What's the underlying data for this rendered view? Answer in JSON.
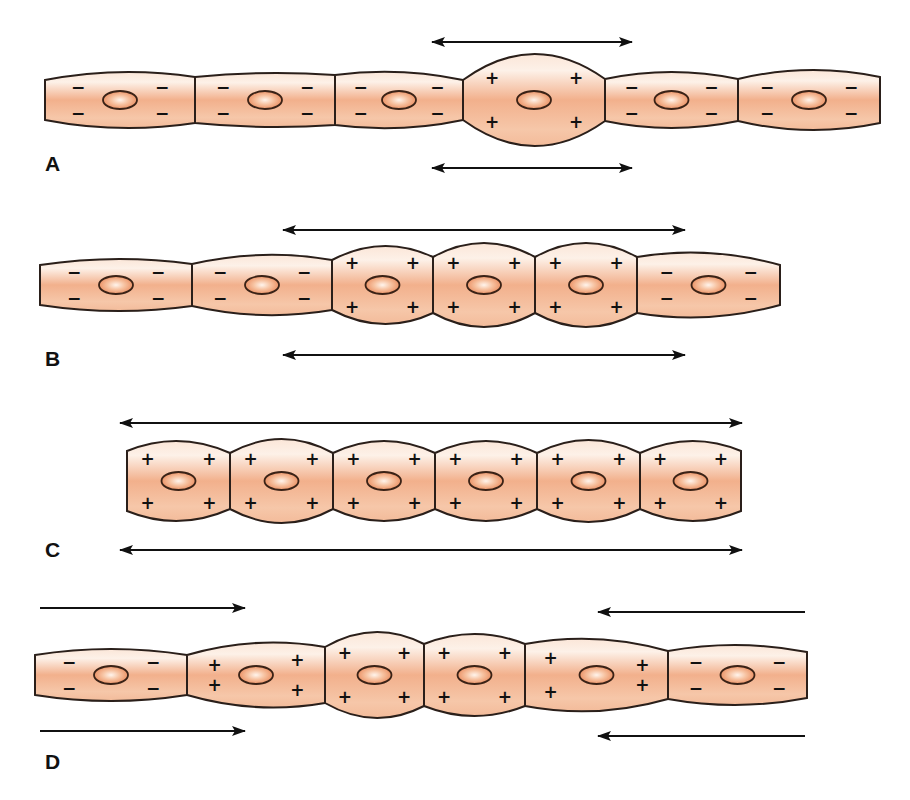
{
  "colors": {
    "cell_fill_center": "#f2b08c",
    "cell_fill_edge": "#fbe6d8",
    "outline": "#2a1f1a",
    "nucleus_center": "#fff4ec",
    "nucleus_edge": "#e98a5c",
    "arrow": "#111111"
  },
  "panels": [
    {
      "label": "A",
      "label_pos": [
        45,
        160
      ],
      "cy": 100,
      "cells": [
        {
          "x0": 45,
          "x1": 195,
          "hl": 40,
          "hm": 56,
          "hr": 46,
          "charge": "-",
          "marks": "quad"
        },
        {
          "x0": 195,
          "x1": 335,
          "hl": 46,
          "hm": 54,
          "hr": 50,
          "charge": "-",
          "marks": "quad"
        },
        {
          "x0": 335,
          "x1": 463,
          "hl": 50,
          "hm": 56,
          "hr": 40,
          "charge": "-",
          "marks": "quad"
        },
        {
          "x0": 463,
          "x1": 605,
          "hl": 40,
          "hm": 92,
          "hr": 42,
          "charge": "+",
          "marks": "quad"
        },
        {
          "x0": 605,
          "x1": 738,
          "hl": 42,
          "hm": 56,
          "hr": 42,
          "charge": "-",
          "marks": "quad"
        },
        {
          "x0": 738,
          "x1": 880,
          "hl": 42,
          "hm": 60,
          "hr": 46,
          "charge": "-",
          "marks": "quad"
        }
      ],
      "arrows": [
        {
          "x1": 432,
          "x2": 632,
          "y": 42,
          "dir": "both"
        },
        {
          "x1": 432,
          "x2": 632,
          "y": 168,
          "dir": "both"
        }
      ]
    },
    {
      "label": "B",
      "label_pos": [
        45,
        355
      ],
      "cy": 285,
      "cells": [
        {
          "x0": 40,
          "x1": 192,
          "hl": 40,
          "hm": 52,
          "hr": 42,
          "charge": "-",
          "marks": "quad"
        },
        {
          "x0": 192,
          "x1": 332,
          "hl": 42,
          "hm": 60,
          "hr": 50,
          "charge": "-",
          "marks": "quad"
        },
        {
          "x0": 332,
          "x1": 433,
          "hl": 50,
          "hm": 78,
          "hr": 56,
          "charge": "+",
          "marks": "quad"
        },
        {
          "x0": 433,
          "x1": 535,
          "hl": 56,
          "hm": 84,
          "hr": 56,
          "charge": "+",
          "marks": "quad"
        },
        {
          "x0": 535,
          "x1": 637,
          "hl": 56,
          "hm": 84,
          "hr": 56,
          "charge": "+",
          "marks": "quad"
        },
        {
          "x0": 637,
          "x1": 780,
          "hl": 56,
          "hm": 64,
          "hr": 40,
          "charge": "-",
          "marks": "quad",
          "taper": "right"
        }
      ],
      "arrows": [
        {
          "x1": 283,
          "x2": 685,
          "y": 230,
          "dir": "both"
        },
        {
          "x1": 283,
          "x2": 685,
          "y": 355,
          "dir": "both"
        }
      ]
    },
    {
      "label": "C",
      "label_pos": [
        45,
        545
      ],
      "cy": 481,
      "cells": [
        {
          "x0": 127,
          "x1": 230,
          "hl": 60,
          "hm": 80,
          "hr": 56,
          "charge": "+",
          "marks": "quad"
        },
        {
          "x0": 230,
          "x1": 333,
          "hl": 56,
          "hm": 84,
          "hr": 56,
          "charge": "+",
          "marks": "quad"
        },
        {
          "x0": 333,
          "x1": 435,
          "hl": 56,
          "hm": 80,
          "hr": 56,
          "charge": "+",
          "marks": "quad"
        },
        {
          "x0": 435,
          "x1": 537,
          "hl": 56,
          "hm": 80,
          "hr": 56,
          "charge": "+",
          "marks": "quad"
        },
        {
          "x0": 537,
          "x1": 640,
          "hl": 56,
          "hm": 82,
          "hr": 56,
          "charge": "+",
          "marks": "quad"
        },
        {
          "x0": 640,
          "x1": 741,
          "hl": 56,
          "hm": 80,
          "hr": 60,
          "charge": "+",
          "marks": "quad"
        }
      ],
      "arrows": [
        {
          "x1": 120,
          "x2": 742,
          "y": 423,
          "dir": "both"
        },
        {
          "x1": 120,
          "x2": 742,
          "y": 550,
          "dir": "both"
        }
      ]
    },
    {
      "label": "D",
      "label_pos": [
        45,
        755
      ],
      "cy": 675,
      "cells": [
        {
          "x0": 35,
          "x1": 187,
          "hl": 40,
          "hm": 52,
          "hr": 40,
          "charge": "-",
          "marks": "quad"
        },
        {
          "x0": 187,
          "x1": 325,
          "hl": 40,
          "hm": 64,
          "hr": 56,
          "charge": "+",
          "marks": "left3"
        },
        {
          "x0": 325,
          "x1": 424,
          "hl": 56,
          "hm": 86,
          "hr": 62,
          "charge": "+",
          "marks": "quad"
        },
        {
          "x0": 424,
          "x1": 525,
          "hl": 62,
          "hm": 82,
          "hr": 62,
          "charge": "+",
          "marks": "quad"
        },
        {
          "x0": 525,
          "x1": 668,
          "hl": 62,
          "hm": 72,
          "hr": 48,
          "charge": "+",
          "marks": "right3"
        },
        {
          "x0": 668,
          "x1": 807,
          "hl": 48,
          "hm": 60,
          "hr": 46,
          "charge": "-",
          "marks": "quad"
        }
      ],
      "arrows": [
        {
          "x1": 40,
          "x2": 245,
          "y": 608,
          "dir": "right"
        },
        {
          "x1": 40,
          "x2": 245,
          "y": 731,
          "dir": "right"
        },
        {
          "x1": 598,
          "x2": 805,
          "y": 612,
          "dir": "left"
        },
        {
          "x1": 598,
          "x2": 805,
          "y": 736,
          "dir": "left"
        }
      ]
    }
  ]
}
